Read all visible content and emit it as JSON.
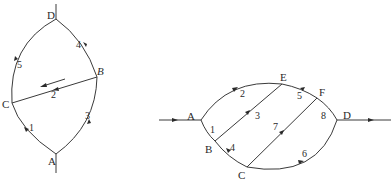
{
  "diagram_left": {
    "nodes": {
      "A": {
        "label": "A",
        "x": 56,
        "y": 154
      },
      "B": {
        "label": "B",
        "x": 97,
        "y": 77
      },
      "C": {
        "label": "C",
        "x": 12,
        "y": 103
      },
      "D": {
        "label": "D",
        "x": 56,
        "y": 19
      }
    },
    "edges": [
      {
        "id": "1",
        "label": "1",
        "from": "A",
        "to": "C"
      },
      {
        "id": "2",
        "label": "2",
        "from": "B",
        "to": "C"
      },
      {
        "id": "3",
        "label": "3",
        "from": "A",
        "to": "B"
      },
      {
        "id": "4",
        "label": "4",
        "from": "B",
        "to": "D"
      },
      {
        "id": "5",
        "label": "5",
        "from": "C",
        "to": "D"
      }
    ],
    "flow_arrow": "arrow indicating flow direction from B toward C"
  },
  "diagram_right": {
    "nodes": {
      "A": {
        "label": "A",
        "x": 201,
        "y": 120
      },
      "B": {
        "label": "B",
        "x": 215,
        "y": 141
      },
      "C": {
        "label": "C",
        "x": 247,
        "y": 167
      },
      "D": {
        "label": "D",
        "x": 337,
        "y": 120
      },
      "E": {
        "label": "E",
        "x": 282,
        "y": 84
      },
      "F": {
        "label": "F",
        "x": 317,
        "y": 98
      }
    },
    "edges": [
      {
        "id": "1",
        "label": "1",
        "from": "A",
        "to": "B"
      },
      {
        "id": "2",
        "label": "2",
        "from": "A",
        "to": "E"
      },
      {
        "id": "3",
        "label": "3",
        "from": "B",
        "to": "E"
      },
      {
        "id": "4",
        "label": "4",
        "from": "B",
        "to": "C"
      },
      {
        "id": "5",
        "label": "5",
        "from": "F",
        "to": "E"
      },
      {
        "id": "6",
        "label": "6",
        "from": "C",
        "to": "D"
      },
      {
        "id": "7",
        "label": "7",
        "from": "C",
        "to": "F"
      },
      {
        "id": "8",
        "label": "8",
        "from": "F",
        "to": "D"
      }
    ],
    "input_label": "",
    "output_label": ""
  }
}
